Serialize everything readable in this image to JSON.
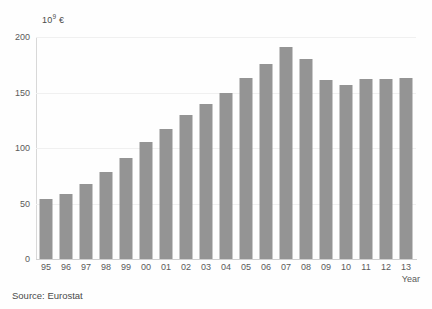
{
  "chart_data": {
    "type": "bar",
    "title": "",
    "subtitle": "",
    "xlabel": "Year",
    "ylabel": "10⁹ €",
    "ylabel_base": "10",
    "ylabel_exp": "9",
    "ylabel_unit": "€",
    "categories": [
      "95",
      "96",
      "97",
      "98",
      "99",
      "00",
      "01",
      "02",
      "03",
      "04",
      "05",
      "06",
      "07",
      "08",
      "09",
      "10",
      "11",
      "12",
      "13"
    ],
    "values": [
      54,
      59,
      68,
      78,
      91,
      105,
      117,
      130,
      140,
      150,
      163,
      176,
      191,
      180,
      161,
      157,
      162,
      162,
      163
    ],
    "series": [
      {
        "name": "Value",
        "values": [
          54,
          59,
          68,
          78,
          91,
          105,
          117,
          130,
          140,
          150,
          163,
          176,
          191,
          180,
          161,
          157,
          162,
          162,
          163
        ]
      }
    ],
    "ylim": [
      0,
      200
    ],
    "yticks": [
      0,
      50,
      100,
      150,
      200
    ],
    "ytick_labels": [
      "0",
      "50",
      "100",
      "150",
      "200"
    ],
    "grid": true,
    "grid_axis": "y",
    "legend": false,
    "legend_position": "none",
    "bar_color": "#949494",
    "background_color": "#fefefe",
    "gridline_color": "#f0f0f0",
    "axis_color": "#d0d0d0",
    "tick_label_color": "#5a5a5a"
  },
  "notes": {
    "source": "Source: Eurostat"
  },
  "axis": {
    "x_title": "Year",
    "y_unit_base": "10",
    "y_unit_exp": "9",
    "y_unit_currency": "€"
  }
}
